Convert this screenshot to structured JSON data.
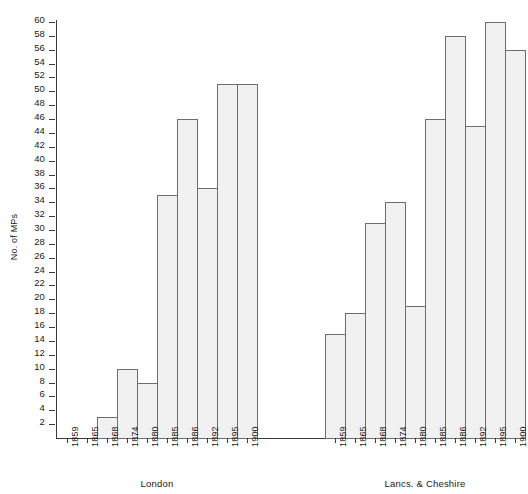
{
  "chart_data": {
    "type": "bar",
    "title": "",
    "xlabel": "",
    "ylabel": "No. of MPs",
    "ylim": [
      0,
      60
    ],
    "ytick_step": 2,
    "grid": false,
    "legend": "none",
    "categories": [
      "1859",
      "1865",
      "1868",
      "1874",
      "1880",
      "1885",
      "1886",
      "1892",
      "1895",
      "1900"
    ],
    "groups": [
      {
        "name": "London",
        "values": [
          0,
          0,
          3,
          10,
          8,
          35,
          46,
          36,
          51,
          51
        ]
      },
      {
        "name": "Lancs. & Cheshire",
        "values": [
          15,
          18,
          31,
          34,
          19,
          46,
          58,
          45,
          60,
          56
        ]
      }
    ],
    "yticks": [
      "2",
      "4",
      "6",
      "8",
      "10",
      "12",
      "14",
      "16",
      "18",
      "20",
      "22",
      "24",
      "26",
      "28",
      "30",
      "32",
      "34",
      "36",
      "38",
      "40",
      "42",
      "44",
      "46",
      "48",
      "50",
      "52",
      "54",
      "56",
      "58",
      "60"
    ],
    "colors": {
      "bar_fill": "#f1f1f1",
      "bar_stroke": "#6d6d6d",
      "axis": "#3a3a3a",
      "text": "#1a1a1a",
      "background": "#ffffff"
    }
  }
}
